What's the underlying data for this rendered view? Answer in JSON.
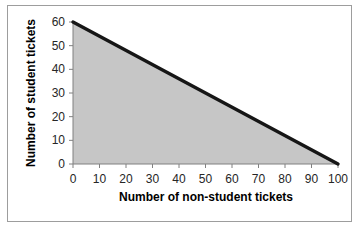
{
  "chart_data": {
    "type": "area",
    "title": "",
    "xlabel": "Number of non-student tickets",
    "ylabel": "Number of student tickets",
    "x": [
      0,
      100
    ],
    "y": [
      60,
      0
    ],
    "xlim": [
      0,
      100
    ],
    "ylim": [
      0,
      60
    ],
    "xticks": [
      0,
      10,
      20,
      30,
      40,
      50,
      60,
      70,
      80,
      90,
      100
    ],
    "yticks": [
      0,
      10,
      20,
      30,
      40,
      50,
      60
    ],
    "grid": false,
    "legend": null,
    "series": [
      {
        "name": "feasible-region-boundary",
        "x": [
          0,
          100
        ],
        "y": [
          60,
          0
        ]
      }
    ],
    "colors": {
      "area_fill": "#c6c6c6",
      "line": "#161616",
      "axis": "#808080",
      "tick_label": "#262626",
      "frame_border": "#9d9d9d",
      "background": "#ffffff"
    }
  }
}
